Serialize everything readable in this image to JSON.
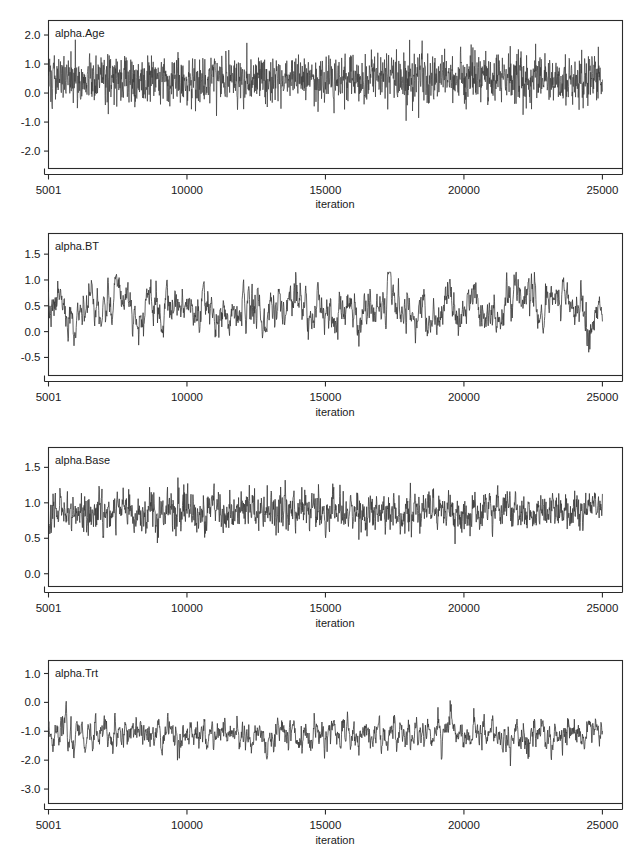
{
  "figure": {
    "kind": "mcmc-trace-panels",
    "background": "#ffffff",
    "trace_color": "#3a3a3a",
    "axis_color": "#2b2b2b",
    "panel_count": 4
  },
  "chart_data": [
    {
      "type": "line",
      "title": "alpha.Age",
      "xlabel": "iteration",
      "ylabel": "",
      "grid": false,
      "legend": "none",
      "xlim": [
        5001,
        25000
      ],
      "ylim": [
        -2.6,
        2.5
      ],
      "xticks": [
        5001,
        10000,
        15000,
        20000,
        25000
      ],
      "xtick_labels": [
        "5001",
        "10000",
        "15000",
        "20000",
        "25000"
      ],
      "yticks": [
        2.0,
        1.0,
        0.0,
        -1.0,
        -2.0
      ],
      "ytick_labels": [
        "2.0",
        "1.0",
        "0.0",
        "-1.0",
        "-2.0"
      ],
      "series": [
        {
          "name": "alpha.Age",
          "mean": 0.5,
          "sd": 0.42,
          "autocorrelation": 0.12,
          "min": -1.25,
          "max": 1.95,
          "n_points": 20000,
          "description": "high-frequency well-mixed chain centred near 0.5"
        }
      ]
    },
    {
      "type": "line",
      "title": "alpha.BT",
      "xlabel": "iteration",
      "ylabel": "",
      "grid": false,
      "legend": "none",
      "xlim": [
        5001,
        25000
      ],
      "ylim": [
        -0.85,
        1.9
      ],
      "xticks": [
        5001,
        10000,
        15000,
        20000,
        25000
      ],
      "xtick_labels": [
        "5001",
        "10000",
        "15000",
        "20000",
        "25000"
      ],
      "yticks": [
        1.5,
        1.0,
        0.5,
        0.0,
        -0.5
      ],
      "ytick_labels": [
        "1.5",
        "1.0",
        "0.5",
        "0.0",
        "-0.5"
      ],
      "series": [
        {
          "name": "alpha.BT",
          "mean": 0.45,
          "sd": 0.25,
          "autocorrelation": 0.78,
          "min": -0.4,
          "max": 1.15,
          "n_points": 20000,
          "description": "slowly mixing chain centred near 0.45"
        }
      ]
    },
    {
      "type": "line",
      "title": "alpha.Base",
      "xlabel": "iteration",
      "ylabel": "",
      "grid": false,
      "legend": "none",
      "xlim": [
        5001,
        25000
      ],
      "ylim": [
        -0.18,
        1.78
      ],
      "xticks": [
        5001,
        10000,
        15000,
        20000,
        25000
      ],
      "xtick_labels": [
        "5001",
        "10000",
        "15000",
        "20000",
        "25000"
      ],
      "yticks": [
        1.5,
        1.0,
        0.5,
        0.0
      ],
      "ytick_labels": [
        "1.5",
        "1.0",
        "0.5",
        "0.0"
      ],
      "series": [
        {
          "name": "alpha.Base",
          "mean": 0.88,
          "sd": 0.14,
          "autocorrelation": 0.45,
          "min": 0.42,
          "max": 1.42,
          "n_points": 20000,
          "description": "moderately mixing chain centred near 0.88"
        }
      ]
    },
    {
      "type": "line",
      "title": "alpha.Trt",
      "xlabel": "iteration",
      "ylabel": "",
      "grid": false,
      "legend": "none",
      "xlim": [
        5001,
        25000
      ],
      "ylim": [
        -3.5,
        1.45
      ],
      "xticks": [
        5001,
        10000,
        15000,
        20000,
        25000
      ],
      "xtick_labels": [
        "5001",
        "10000",
        "15000",
        "20000",
        "25000"
      ],
      "yticks": [
        1.0,
        0.0,
        -1.0,
        -2.0,
        -3.0
      ],
      "ytick_labels": [
        "1.0",
        "0.0",
        "-1.0",
        "-2.0",
        "-3.0"
      ],
      "series": [
        {
          "name": "alpha.Trt",
          "mean": -1.1,
          "sd": 0.32,
          "autocorrelation": 0.72,
          "min": -2.2,
          "max": 0.35,
          "n_points": 20000,
          "description": "slowly mixing chain centred near -1.1"
        }
      ]
    }
  ]
}
